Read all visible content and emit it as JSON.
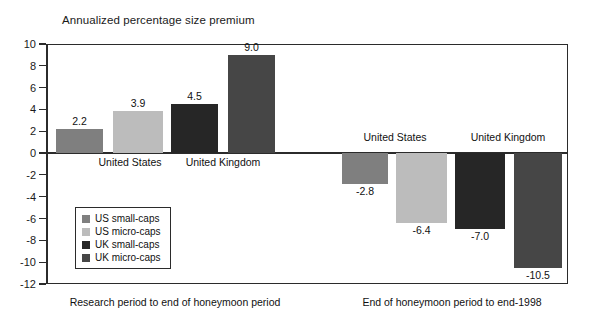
{
  "chart_data": {
    "type": "bar",
    "title": "Annualized percentage size premium",
    "xlabel": "",
    "ylabel": "",
    "ylim": [
      -12,
      10
    ],
    "ytick_step": 2,
    "yticks": [
      "10",
      "8",
      "6",
      "4",
      "2",
      "0",
      "-2",
      "-4",
      "-6",
      "-8",
      "-10",
      "-12"
    ],
    "grid": false,
    "legend_position": "inner-left",
    "series": [
      {
        "name": "US small-caps",
        "color": "#7f7f7f",
        "values": [
          2.2,
          -2.8
        ]
      },
      {
        "name": "US micro-caps",
        "color": "#bcbcbc",
        "values": [
          3.9,
          -6.4
        ]
      },
      {
        "name": "UK small-caps",
        "color": "#262626",
        "values": [
          4.5,
          -7.0
        ]
      },
      {
        "name": "UK micro-caps",
        "color": "#464646",
        "values": [
          9.0,
          -10.5
        ]
      }
    ],
    "panels": [
      {
        "caption": "Research period to end of honeymoon period",
        "groups": [
          {
            "label": "United States",
            "bars": [
              {
                "series": "US small-caps",
                "value": 2.2,
                "label": "2.2",
                "color": "#7f7f7f"
              },
              {
                "series": "US micro-caps",
                "value": 3.9,
                "label": "3.9",
                "color": "#bcbcbc"
              }
            ]
          },
          {
            "label": "United Kingdom",
            "bars": [
              {
                "series": "UK small-caps",
                "value": 4.5,
                "label": "4.5",
                "color": "#262626"
              },
              {
                "series": "UK micro-caps",
                "value": 9.0,
                "label": "9.0",
                "color": "#464646"
              }
            ]
          }
        ]
      },
      {
        "caption": "End of honeymoon period to end-1998",
        "groups": [
          {
            "label": "United States",
            "bars": [
              {
                "series": "US small-caps",
                "value": -2.8,
                "label": "-2.8",
                "color": "#7f7f7f"
              },
              {
                "series": "US micro-caps",
                "value": -6.4,
                "label": "-6.4",
                "color": "#bcbcbc"
              }
            ]
          },
          {
            "label": "United Kingdom",
            "bars": [
              {
                "series": "UK small-caps",
                "value": -7.0,
                "label": "-7.0",
                "color": "#262626"
              },
              {
                "series": "UK micro-caps",
                "value": -10.5,
                "label": "-10.5",
                "color": "#464646"
              }
            ]
          }
        ]
      }
    ]
  },
  "title": {
    "text": "Annualized percentage size premium"
  },
  "axis": {
    "labels": [
      "10",
      "8",
      "6",
      "4",
      "2",
      "0",
      "-2",
      "-4",
      "-6",
      "-8",
      "-10",
      "-12"
    ]
  },
  "legend": {
    "items": [
      {
        "label": "US small-caps",
        "color": "#7f7f7f"
      },
      {
        "label": "US micro-caps",
        "color": "#bcbcbc"
      },
      {
        "label": "UK small-caps",
        "color": "#262626"
      },
      {
        "label": "UK micro-caps",
        "color": "#464646"
      }
    ]
  },
  "group_labels": {
    "left_us": "United States",
    "left_uk": "United Kingdom",
    "right_us": "United States",
    "right_uk": "United Kingdom"
  },
  "bar_values": {
    "l1": "2.2",
    "l2": "3.9",
    "l3": "4.5",
    "l4": "9.0",
    "r1": "-2.8",
    "r2": "-6.4",
    "r3": "-7.0",
    "r4": "-10.5"
  },
  "captions": {
    "left": "Research period to end of honeymoon period",
    "right": "End of honeymoon period to end-1998"
  }
}
